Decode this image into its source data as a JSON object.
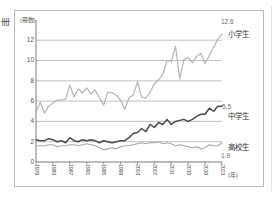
{
  "figure": {
    "edge_glyph": "冊",
    "y_axis_unit": "(冊数)",
    "x_axis_unit": "(年)"
  },
  "chart_data": {
    "type": "line",
    "title": "",
    "subtitle": "",
    "xlabel": "(年)",
    "ylabel": "(冊数)",
    "ylim": [
      0,
      13.4
    ],
    "yticks": [
      0,
      2,
      4,
      6,
      8,
      10,
      12
    ],
    "grid": "horizontal",
    "legend_position": "right-inline",
    "x": [
      1979,
      1980,
      1981,
      1982,
      1983,
      1984,
      1985,
      1986,
      1987,
      1988,
      1989,
      1990,
      1991,
      1992,
      1993,
      1994,
      1995,
      1996,
      1997,
      1998,
      1999,
      2000,
      2001,
      2002,
      2003,
      2004,
      2005,
      2006,
      2007,
      2008,
      2009,
      2010,
      2011,
      2012,
      2013,
      2014,
      2015,
      2016,
      2017,
      2018,
      2019,
      2020,
      2021,
      2022,
      2023
    ],
    "xticks": [
      1979,
      1983,
      1987,
      1991,
      1995,
      1999,
      2003,
      2007,
      2011,
      2015,
      2019,
      2023
    ],
    "xticklabels": [
      "1979",
      "1983",
      "1987",
      "1991",
      "1995",
      "1999",
      "2003",
      "2007",
      "2011",
      "2015",
      "2019",
      "2023"
    ],
    "series": [
      {
        "name": "小学生",
        "label": "小学生",
        "color": "#b4b4b4",
        "end_value": 12.6,
        "end_value_label": "12.6",
        "values": [
          4.9,
          5.9,
          4.8,
          5.5,
          5.8,
          6.1,
          6.1,
          6.2,
          7.6,
          6.4,
          7.2,
          6.8,
          7.3,
          6.7,
          7.1,
          6.3,
          5.6,
          6.9,
          6.8,
          6.6,
          6.1,
          5.2,
          6.3,
          6.6,
          7.9,
          6.4,
          6.3,
          6.9,
          7.7,
          8.1,
          8.6,
          10.0,
          9.9,
          11.4,
          8.2,
          10.1,
          10.3,
          9.8,
          10.4,
          10.7,
          9.7,
          10.5,
          11.3,
          12.1,
          12.6
        ]
      },
      {
        "name": "中学生",
        "label": "中学生",
        "color": "#4a4a4a",
        "end_value": 5.5,
        "end_value_label": "5.5",
        "values": [
          2.2,
          2.1,
          2.1,
          2.3,
          2.2,
          2.0,
          2.1,
          1.9,
          2.4,
          2.1,
          2.0,
          2.2,
          2.1,
          2.2,
          2.1,
          1.9,
          2.1,
          2.0,
          1.9,
          2.0,
          2.1,
          2.1,
          2.4,
          2.8,
          2.9,
          3.3,
          3.0,
          3.7,
          3.4,
          3.9,
          3.7,
          4.2,
          3.7,
          4.0,
          4.1,
          4.2,
          4.0,
          4.2,
          4.5,
          4.7,
          4.7,
          5.3,
          5.0,
          5.5,
          5.5
        ]
      },
      {
        "name": "高校生",
        "label": "高校生",
        "color": "#a8a8a8",
        "end_value": 1.9,
        "end_value_label": "1.9",
        "values": [
          1.6,
          1.6,
          1.6,
          1.7,
          1.7,
          1.5,
          1.6,
          1.6,
          1.7,
          1.7,
          1.6,
          1.7,
          1.8,
          1.7,
          1.6,
          1.4,
          1.2,
          1.3,
          1.4,
          1.3,
          1.5,
          1.6,
          1.6,
          1.7,
          1.8,
          1.9,
          1.8,
          1.9,
          1.9,
          2.0,
          1.8,
          1.9,
          1.8,
          1.6,
          1.7,
          1.6,
          1.5,
          1.4,
          1.5,
          1.3,
          1.4,
          1.7,
          1.6,
          1.6,
          1.9
        ]
      }
    ]
  }
}
